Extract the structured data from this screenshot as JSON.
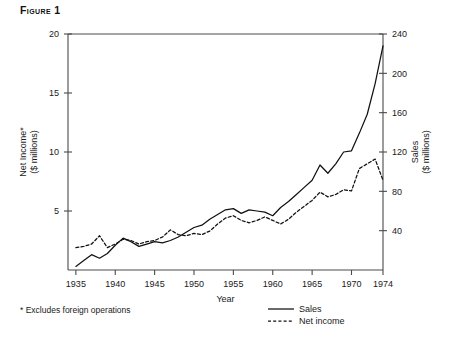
{
  "figure": {
    "title": "Figure 1",
    "footnote": "* Excludes foreign operations"
  },
  "chart_data": {
    "type": "line",
    "title": "Figure 1",
    "xlabel": "Year",
    "ylabel": "Net Income*\n($ millions)",
    "y2label": "Sales\n($ millions)",
    "grid": false,
    "legend_position": "bottom-right",
    "xlim": [
      1934,
      1974
    ],
    "ylim": [
      0,
      20
    ],
    "y2lim": [
      0,
      240
    ],
    "xticks": [
      1935,
      1940,
      1945,
      1950,
      1955,
      1960,
      1965,
      1970,
      1974
    ],
    "xtick_labels": [
      "1935",
      "1940",
      "1945",
      "1950",
      "1955",
      "1960",
      "1965",
      "1970",
      "1974"
    ],
    "yticks": [
      5,
      10,
      15,
      20
    ],
    "ytick_labels": [
      "5",
      "10",
      "15",
      "20"
    ],
    "y2ticks": [
      40,
      80,
      120,
      160,
      200,
      240
    ],
    "y2tick_labels": [
      "40",
      "80",
      "120",
      "160",
      "200",
      "240"
    ],
    "axis_left_label": "Net Income*",
    "axis_left_label_2": "($ millions)",
    "axis_right_label": "Sales",
    "axis_right_label_2": "($ millions)",
    "x": [
      1935,
      1936,
      1937,
      1938,
      1939,
      1940,
      1941,
      1942,
      1943,
      1944,
      1945,
      1946,
      1947,
      1948,
      1949,
      1950,
      1951,
      1952,
      1953,
      1954,
      1955,
      1956,
      1957,
      1958,
      1959,
      1960,
      1961,
      1962,
      1963,
      1964,
      1965,
      1966,
      1967,
      1968,
      1969,
      1970,
      1971,
      1972,
      1973,
      1974
    ],
    "series": [
      {
        "name": "Sales",
        "style": "solid",
        "axis": "right",
        "unit": "$ millions",
        "values_left_scale": [
          0.3,
          0.8,
          1.3,
          1.0,
          1.4,
          2.1,
          2.7,
          2.4,
          2.0,
          2.2,
          2.4,
          2.3,
          2.5,
          2.8,
          3.2,
          3.6,
          3.8,
          4.3,
          4.7,
          5.1,
          5.2,
          4.8,
          5.1,
          5.0,
          4.9,
          4.6,
          5.3,
          5.8,
          6.4,
          7.0,
          7.6,
          8.9,
          8.2,
          9.0,
          10.0,
          10.1,
          11.6,
          13.2,
          15.8,
          19.0
        ],
        "values": [
          3.6,
          9.6,
          15.6,
          12.0,
          16.8,
          25.2,
          32.4,
          28.8,
          24.0,
          26.4,
          28.8,
          27.6,
          30.0,
          33.6,
          38.4,
          43.2,
          45.6,
          51.6,
          56.4,
          61.2,
          62.4,
          57.6,
          61.2,
          60.0,
          58.8,
          55.2,
          63.6,
          69.6,
          76.8,
          84.0,
          91.2,
          106.8,
          98.4,
          108.0,
          120.0,
          121.2,
          139.2,
          158.4,
          189.6,
          228.0
        ]
      },
      {
        "name": "Net income",
        "style": "dashed",
        "axis": "left",
        "unit": "$ millions",
        "values": [
          1.9,
          2.0,
          2.2,
          2.9,
          1.9,
          2.2,
          2.6,
          2.5,
          2.2,
          2.4,
          2.5,
          2.8,
          3.4,
          3.0,
          2.9,
          3.1,
          3.0,
          3.3,
          3.9,
          4.4,
          4.6,
          4.2,
          4.0,
          4.2,
          4.5,
          4.2,
          3.9,
          4.3,
          4.9,
          5.4,
          5.9,
          6.6,
          6.2,
          6.4,
          6.8,
          6.7,
          8.6,
          9.0,
          9.4,
          7.6
        ]
      }
    ],
    "legend": [
      {
        "label": "Sales",
        "style": "solid"
      },
      {
        "label": "Net income",
        "style": "dashed"
      }
    ]
  }
}
